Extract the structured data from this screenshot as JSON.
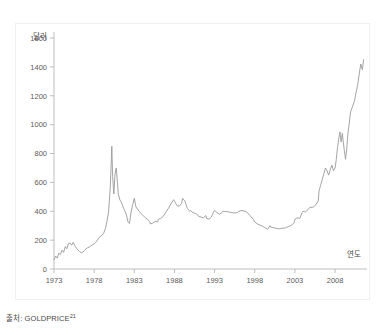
{
  "caption": {
    "prefix": "출처: GOLDPRICE",
    "footnote": "21"
  },
  "chart_data": {
    "type": "line",
    "title": "",
    "subtitle": "",
    "xlabel": "연도",
    "ylabel": "달러",
    "grid": false,
    "legend": "none",
    "line_color": "#9a9a9a",
    "axis_color": "#bdbdbd",
    "xlim": [
      1973,
      2011.6
    ],
    "ylim": [
      0,
      1600
    ],
    "xticks": [
      1973,
      1978,
      1983,
      1988,
      1993,
      1998,
      2003,
      2008
    ],
    "xtick_labels": [
      "1973",
      "1978",
      "1983",
      "1988",
      "1993",
      "1998",
      "2003",
      "2008"
    ],
    "yticks": [
      0,
      200,
      400,
      600,
      800,
      1000,
      1200,
      1400,
      1600
    ],
    "ytick_labels": [
      "0",
      "200",
      "400",
      "600",
      "800",
      "1000",
      "1200",
      "1400",
      "1600"
    ],
    "series": [
      {
        "name": "Gold price",
        "x": [
          1973.0,
          1973.2,
          1973.4,
          1973.6,
          1973.8,
          1974.0,
          1974.2,
          1974.4,
          1974.6,
          1974.8,
          1975.0,
          1975.2,
          1975.4,
          1975.6,
          1975.8,
          1976.0,
          1976.2,
          1976.4,
          1976.6,
          1976.8,
          1977.0,
          1977.2,
          1977.4,
          1977.6,
          1977.8,
          1978.0,
          1978.2,
          1978.4,
          1978.6,
          1978.8,
          1979.0,
          1979.2,
          1979.4,
          1979.6,
          1979.8,
          1980.0,
          1980.1,
          1980.2,
          1980.3,
          1980.45,
          1980.6,
          1980.75,
          1980.9,
          1981.0,
          1981.2,
          1981.4,
          1981.6,
          1981.8,
          1982.0,
          1982.2,
          1982.4,
          1982.6,
          1982.8,
          1983.0,
          1983.2,
          1983.4,
          1983.6,
          1983.8,
          1984.0,
          1984.3,
          1984.6,
          1984.9,
          1985.0,
          1985.3,
          1985.6,
          1985.9,
          1986.0,
          1986.3,
          1986.6,
          1986.9,
          1987.0,
          1987.3,
          1987.6,
          1987.9,
          1988.0,
          1988.3,
          1988.6,
          1988.9,
          1989.0,
          1989.3,
          1989.6,
          1989.9,
          1990.0,
          1990.3,
          1990.6,
          1990.9,
          1991.0,
          1991.3,
          1991.6,
          1991.9,
          1992.0,
          1992.3,
          1992.6,
          1992.9,
          1993.0,
          1993.3,
          1993.6,
          1993.9,
          1994.0,
          1994.4,
          1994.8,
          1995.0,
          1995.4,
          1995.8,
          1996.0,
          1996.4,
          1996.8,
          1997.0,
          1997.4,
          1997.8,
          1998.0,
          1998.4,
          1998.8,
          1999.0,
          1999.3,
          1999.6,
          1999.9,
          2000.0,
          2000.4,
          2000.8,
          2001.0,
          2001.4,
          2001.8,
          2002.0,
          2002.3,
          2002.6,
          2002.9,
          2003.0,
          2003.3,
          2003.6,
          2003.9,
          2004.0,
          2004.3,
          2004.6,
          2004.9,
          2005.0,
          2005.3,
          2005.6,
          2005.9,
          2006.0,
          2006.2,
          2006.4,
          2006.6,
          2006.8,
          2007.0,
          2007.2,
          2007.4,
          2007.6,
          2007.8,
          2008.0,
          2008.15,
          2008.3,
          2008.45,
          2008.6,
          2008.75,
          2008.9,
          2009.0,
          2009.15,
          2009.3,
          2009.45,
          2009.6,
          2009.75,
          2009.9,
          2010.0,
          2010.2,
          2010.4,
          2010.6,
          2010.8,
          2011.0,
          2011.2,
          2011.4,
          2011.55
        ],
        "values": [
          65,
          90,
          75,
          110,
          100,
          130,
          115,
          155,
          140,
          175,
          180,
          165,
          185,
          160,
          145,
          130,
          120,
          112,
          118,
          128,
          140,
          148,
          152,
          160,
          168,
          175,
          185,
          200,
          215,
          228,
          235,
          250,
          280,
          330,
          400,
          560,
          700,
          850,
          640,
          520,
          660,
          700,
          600,
          520,
          480,
          460,
          430,
          405,
          380,
          330,
          315,
          395,
          445,
          490,
          430,
          415,
          400,
          385,
          375,
          360,
          345,
          330,
          312,
          318,
          330,
          325,
          345,
          350,
          365,
          390,
          400,
          425,
          455,
          480,
          470,
          440,
          435,
          455,
          490,
          470,
          420,
          400,
          405,
          390,
          385,
          375,
          365,
          360,
          355,
          370,
          350,
          345,
          360,
          400,
          405,
          390,
          380,
          390,
          400,
          398,
          395,
          392,
          388,
          390,
          400,
          405,
          400,
          395,
          370,
          345,
          325,
          310,
          300,
          295,
          285,
          275,
          300,
          290,
          285,
          280,
          278,
          282,
          285,
          290,
          295,
          305,
          320,
          345,
          355,
          350,
          390,
          400,
          395,
          410,
          430,
          425,
          430,
          445,
          470,
          540,
          580,
          620,
          660,
          700,
          680,
          650,
          690,
          720,
          680,
          700,
          760,
          840,
          900,
          950,
          880,
          940,
          890,
          820,
          760,
          830,
          940,
          1000,
          1080,
          1100,
          1130,
          1160,
          1220,
          1270,
          1350,
          1420,
          1380,
          1450
        ]
      }
    ]
  }
}
